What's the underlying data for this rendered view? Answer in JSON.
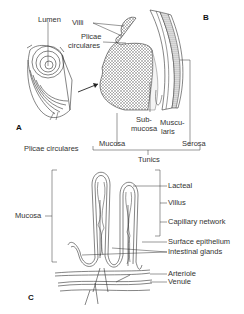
{
  "figure": {
    "panels": {
      "a": {
        "label": "A",
        "callouts": {
          "lumen": "Lumen",
          "plicae_bottom": "Plicae circulares"
        }
      },
      "b": {
        "label": "B",
        "callouts": {
          "villi": "Villi",
          "plicae_line1": "Plicae",
          "plicae_line2": "circulares",
          "submucosa_line1": "Sub-",
          "submucosa_line2": "mucosa",
          "muscularis_line1": "Muscu-",
          "muscularis_line2": "laris",
          "mucosa": "Mucosa",
          "serosa": "Serosa",
          "tunics": "Tunics"
        }
      },
      "c": {
        "label": "C",
        "callouts": {
          "mucosa": "Mucosa",
          "lacteal": "Lacteal",
          "villus": "Villus",
          "capillary_network": "Capillary network",
          "surface_epithelium": "Surface epithelium",
          "intestinal_glands": "Intestinal glands",
          "arteriole": "Arteriole",
          "venule": "Venule"
        }
      }
    },
    "colors": {
      "ink": "#333333",
      "background": "#ffffff",
      "stipple": "#555555"
    }
  }
}
